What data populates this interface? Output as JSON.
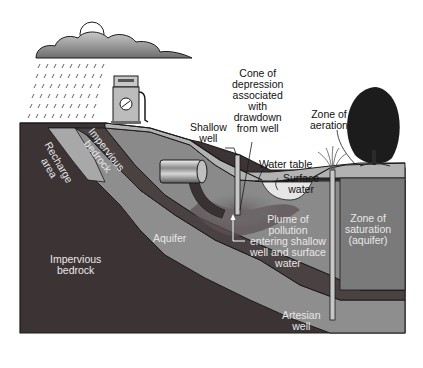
{
  "diagram": {
    "type": "groundwater cross-section",
    "colors": {
      "background": "#ffffff",
      "impervious_bedrock": "#3c3434",
      "aquifer": "#8e8e8e",
      "recharge_area": "#a8a8a8",
      "upper_soil": "#b2b2b2",
      "zone_of_saturation": "#7a7a7a",
      "confining_layer": "#4a4242",
      "plume": "#5c5254",
      "surface_water": "#e6e6e6",
      "cloud": "#9a9a9a",
      "tree": "#1c1c1c",
      "outline": "#1a1a1a"
    },
    "elements": [
      "rain-cloud",
      "rain",
      "gas-pump",
      "underground-storage-tank",
      "shallow-well",
      "artesian-well",
      "surface-water-pond",
      "tree",
      "grass-tuft"
    ]
  },
  "labels": {
    "recharge_area": "Recharge\narea",
    "impervious_bedrock_upper": "Impervious\nbedrock",
    "impervious_bedrock_lower": "Impervious\nbedrock",
    "aquifer": "Aquifer",
    "shallow_well": "Shallow\nwell",
    "cone_of_depression": "Cone of\ndepression\nassociated\nwith\ndrawdown\nfrom well",
    "zone_of_aeration": "Zone of\naeration",
    "water_table": "Water table",
    "surface_water": "Surface\nwater",
    "plume": "Plume of\npollution\nentering shallow\nwell and surface\nwater",
    "zone_of_saturation": "Zone of\nsaturation\n(aquifer)",
    "artesian_well": "Artesian\nwell"
  }
}
